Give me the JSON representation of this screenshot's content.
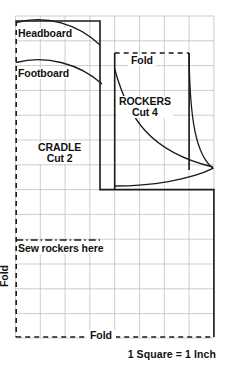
{
  "diagram": {
    "caption": "1 Square  =  1 Inch",
    "labels": {
      "headboard": "Headboard",
      "footboard": "Footboard",
      "fold_top": "Fold",
      "fold_bottom": "Fold",
      "fold_left": "Fold",
      "sew_rockers": "Sew rockers here",
      "rockers_name": "ROCKERS",
      "rockers_cut": "Cut 4",
      "cradle_name": "CRADLE",
      "cradle_cut": "Cut 2"
    },
    "grid": {
      "square_label": "1 Square  =  1 Inch",
      "square_size_px": 24.8,
      "columns": 8,
      "rows": 13,
      "line_color": "#b9b9b9"
    },
    "colors": {
      "ink": "#111111",
      "grid": "#b9b9b9",
      "paper": "#ffffff",
      "outline": "#1a1a1a"
    },
    "pieces": [
      {
        "name": "CRADLE",
        "cut": "Cut 2"
      },
      {
        "name": "ROCKERS",
        "cut": "Cut 4"
      }
    ]
  }
}
